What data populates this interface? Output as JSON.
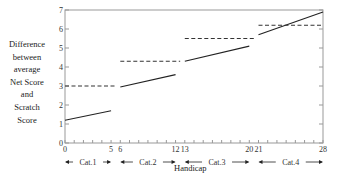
{
  "chart_data": {
    "type": "line",
    "title": "",
    "xlabel": "Handicap",
    "ylabel": [
      "Difference",
      "between",
      "average",
      "Net Score",
      "and",
      "Scratch",
      "Score"
    ],
    "xlim": [
      0,
      28
    ],
    "ylim": [
      0,
      7
    ],
    "y_ticks": [
      0,
      1,
      2,
      3,
      4,
      5,
      6,
      7
    ],
    "x_tick_labels": [
      0,
      5,
      6,
      12,
      13,
      20,
      21,
      28
    ],
    "x_minor_ticks": [
      0,
      1,
      2,
      3,
      4,
      5,
      6,
      7,
      8,
      9,
      10,
      11,
      12,
      13,
      14,
      15,
      16,
      17,
      18,
      19,
      20,
      21,
      22,
      23,
      24,
      25,
      26,
      27,
      28
    ],
    "grid": false,
    "legend": null,
    "categories": [
      {
        "label": "Cat.1",
        "range": [
          0,
          5
        ]
      },
      {
        "label": "Cat.2",
        "range": [
          6,
          12
        ]
      },
      {
        "label": "Cat.3",
        "range": [
          13,
          20
        ]
      },
      {
        "label": "Cat.4",
        "range": [
          21,
          28
        ]
      }
    ],
    "series": [
      {
        "name": "solid (difference trend)",
        "style": "solid",
        "segments": [
          {
            "x": [
              0,
              5
            ],
            "y": [
              1.2,
              1.7
            ]
          },
          {
            "x": [
              6,
              12
            ],
            "y": [
              2.95,
              3.6
            ]
          },
          {
            "x": [
              13,
              20
            ],
            "y": [
              4.3,
              5.1
            ]
          },
          {
            "x": [
              21,
              28
            ],
            "y": [
              5.7,
              6.9
            ]
          }
        ]
      },
      {
        "name": "dashed (category level)",
        "style": "dashed",
        "segments": [
          {
            "x": [
              0,
              5.5
            ],
            "y": [
              3.0,
              3.0
            ]
          },
          {
            "x": [
              6,
              12.5
            ],
            "y": [
              4.3,
              4.3
            ]
          },
          {
            "x": [
              13,
              20.5
            ],
            "y": [
              5.5,
              5.5
            ]
          },
          {
            "x": [
              21,
              28
            ],
            "y": [
              6.2,
              6.2
            ]
          }
        ]
      }
    ]
  },
  "labels": {
    "ylabel_lines": [
      "Difference",
      "between",
      "average",
      "Net Score",
      "and",
      "Scratch",
      "Score"
    ],
    "xlabel": "Handicap"
  },
  "colors": {
    "line": "#222222",
    "axis": "#999999",
    "text": "#333333"
  }
}
